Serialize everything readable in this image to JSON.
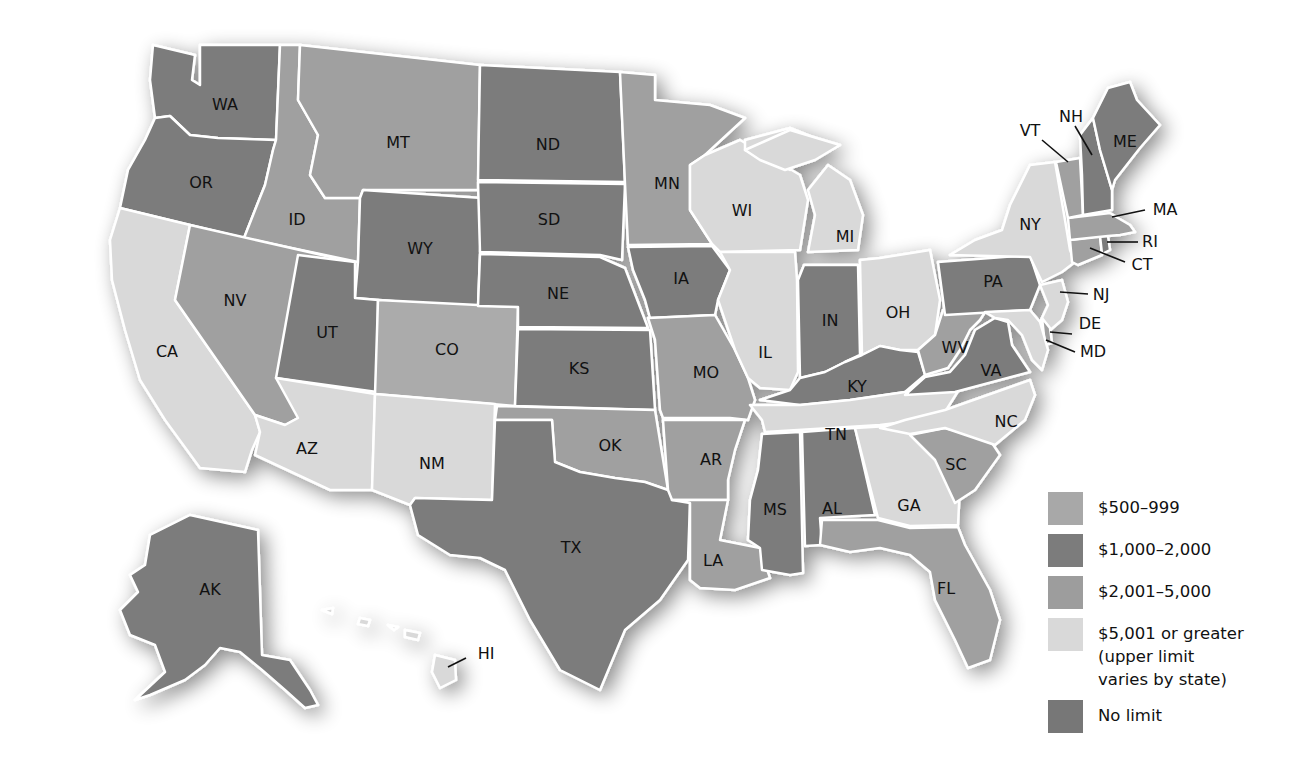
{
  "title": "",
  "categories": {
    "c500": {
      "label": "$500–999",
      "color": "#a8a8a8"
    },
    "c1000": {
      "label": "$1,000–2,000",
      "color": "#7c7c7c"
    },
    "c2001": {
      "label": "$2,001–5,000",
      "color": "#9d9d9d"
    },
    "c5001": {
      "label": "$5,001 or greater\n(upper limit\nvaries by state)",
      "color": "#d9d9d9"
    },
    "none": {
      "label": "No limit",
      "color": "#777777"
    }
  },
  "legend": [
    {
      "key": "c500",
      "label": "$500–999"
    },
    {
      "key": "c1000",
      "label": "$1,000–2,000"
    },
    {
      "key": "c2001",
      "label": "$2,001–5,000"
    },
    {
      "key": "c5001",
      "label": "$5,001 or greater\n(upper limit\nvaries by state)"
    },
    {
      "key": "none",
      "label": "No limit"
    }
  ],
  "states": {
    "WA": {
      "label": "WA",
      "shade": "dark"
    },
    "OR": {
      "label": "OR",
      "shade": "dark"
    },
    "CA": {
      "label": "CA",
      "shade": "light"
    },
    "ID": {
      "label": "ID",
      "shade": "medium"
    },
    "NV": {
      "label": "NV",
      "shade": "medium"
    },
    "MT": {
      "label": "MT",
      "shade": "medium"
    },
    "WY": {
      "label": "WY",
      "shade": "dark"
    },
    "UT": {
      "label": "UT",
      "shade": "dark"
    },
    "AZ": {
      "label": "AZ",
      "shade": "light"
    },
    "CO": {
      "label": "CO",
      "shade": "medium-light"
    },
    "NM": {
      "label": "NM",
      "shade": "light"
    },
    "ND": {
      "label": "ND",
      "shade": "dark"
    },
    "SD": {
      "label": "SD",
      "shade": "dark"
    },
    "NE": {
      "label": "NE",
      "shade": "dark"
    },
    "KS": {
      "label": "KS",
      "shade": "dark"
    },
    "OK": {
      "label": "OK",
      "shade": "medium"
    },
    "TX": {
      "label": "TX",
      "shade": "dark"
    },
    "MN": {
      "label": "MN",
      "shade": "medium"
    },
    "IA": {
      "label": "IA",
      "shade": "dark"
    },
    "MO": {
      "label": "MO",
      "shade": "medium"
    },
    "AR": {
      "label": "AR",
      "shade": "medium"
    },
    "LA": {
      "label": "LA",
      "shade": "medium"
    },
    "WI": {
      "label": "WI",
      "shade": "light"
    },
    "IL": {
      "label": "IL",
      "shade": "light"
    },
    "MI": {
      "label": "MI",
      "shade": "light"
    },
    "IN": {
      "label": "IN",
      "shade": "dark"
    },
    "OH": {
      "label": "OH",
      "shade": "light"
    },
    "KY": {
      "label": "KY",
      "shade": "dark"
    },
    "TN": {
      "label": "TN",
      "shade": "light"
    },
    "MS": {
      "label": "MS",
      "shade": "dark"
    },
    "AL": {
      "label": "AL",
      "shade": "dark"
    },
    "GA": {
      "label": "GA",
      "shade": "light"
    },
    "FL": {
      "label": "FL",
      "shade": "medium"
    },
    "SC": {
      "label": "SC",
      "shade": "medium"
    },
    "NC": {
      "label": "NC",
      "shade": "light"
    },
    "VA": {
      "label": "VA",
      "shade": "dark"
    },
    "WV": {
      "label": "WV",
      "shade": "medium"
    },
    "PA": {
      "label": "PA",
      "shade": "dark"
    },
    "NY": {
      "label": "NY",
      "shade": "light"
    },
    "NJ": {
      "label": "NJ",
      "shade": "light"
    },
    "DE": {
      "label": "DE",
      "shade": "medium"
    },
    "MD": {
      "label": "MD",
      "shade": "light"
    },
    "CT": {
      "label": "CT",
      "shade": "medium"
    },
    "RI": {
      "label": "RI",
      "shade": "dark"
    },
    "MA": {
      "label": "MA",
      "shade": "medium"
    },
    "VT": {
      "label": "VT",
      "shade": "medium"
    },
    "NH": {
      "label": "NH",
      "shade": "dark"
    },
    "ME": {
      "label": "ME",
      "shade": "dark"
    },
    "AK": {
      "label": "AK",
      "shade": "dark"
    },
    "HI": {
      "label": "HI",
      "shade": "light"
    }
  },
  "shades": {
    "dark": "#7b7b7b",
    "medium": "#a0a0a0",
    "medium-light": "#ababab",
    "light": "#d9d9d9"
  }
}
